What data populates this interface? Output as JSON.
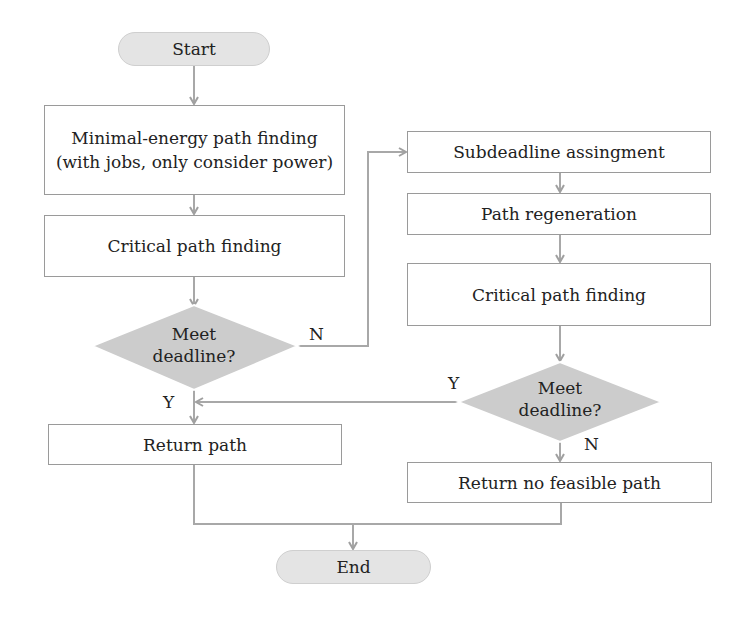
{
  "flowchart": {
    "start": "Start",
    "end": "End",
    "nodes": {
      "min_energy": {
        "line1": "Minimal-energy path finding",
        "line2": "(with jobs, only consider power)"
      },
      "critical_1": "Critical path finding",
      "decision_1": {
        "line1": "Meet",
        "line2": "deadline?"
      },
      "subdeadline": "Subdeadline assingment",
      "regeneration": "Path regeneration",
      "critical_2": "Critical path finding",
      "decision_2": {
        "line1": "Meet",
        "line2": "deadline?"
      },
      "return_path": "Return path",
      "return_none": "Return no feasible path"
    },
    "edge_labels": {
      "d1_no": "N",
      "d1_yes": "Y",
      "d2_yes": "Y",
      "d2_no": "N"
    },
    "colors": {
      "line": "#a0a0a0",
      "terminal_fill": "#e4e4e4",
      "decision_fill": "#cccccc",
      "box_border": "#9a9a9a"
    }
  }
}
